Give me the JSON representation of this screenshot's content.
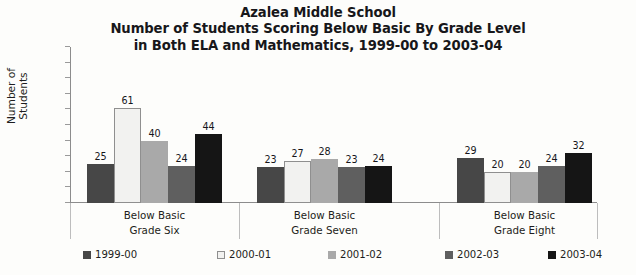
{
  "chart_data": {
    "type": "bar",
    "title": "Azalea Middle School\nNumber of Students Scoring Below Basic By Grade Level\nin Both ELA and Mathematics, 1999-00 to 2003-04",
    "title_lines": [
      "Azalea Middle School",
      "Number of Students Scoring Below Basic By Grade Level",
      "in Both ELA and Mathematics, 1999-00 to 2003-04"
    ],
    "xlabel": "",
    "ylabel": "Number of Students",
    "ylim": [
      0,
      100
    ],
    "yticks": [
      0,
      10,
      20,
      30,
      40,
      50,
      60,
      70,
      80,
      90,
      100
    ],
    "ytick_labels": [
      "0",
      "10",
      "20",
      "30",
      "40",
      "50",
      "60",
      "70",
      "80",
      "90",
      "100"
    ],
    "grid": false,
    "legend_position": "bottom",
    "categories": [
      "Below Basic Grade Six",
      "Below Basic Grade Seven",
      "Below Basic Grade Eight"
    ],
    "category_lines": [
      [
        "Below Basic",
        "Grade Six"
      ],
      [
        "Below Basic",
        "Grade Seven"
      ],
      [
        "Below Basic",
        "Grade Eight"
      ]
    ],
    "series": [
      {
        "name": "1999-00",
        "color": "#474747",
        "values": [
          25,
          23,
          29
        ]
      },
      {
        "name": "2000-01",
        "color": "#f2f2f0",
        "values": [
          61,
          27,
          20
        ]
      },
      {
        "name": "2001-02",
        "color": "#a9a9a9",
        "values": [
          40,
          28,
          20
        ]
      },
      {
        "name": "2002-03",
        "color": "#5f5f5f",
        "values": [
          24,
          23,
          24
        ]
      },
      {
        "name": "2003-04",
        "color": "#151515",
        "values": [
          44,
          24,
          32
        ]
      }
    ],
    "data_labels": [
      [
        "25",
        "61",
        "40",
        "24",
        "44"
      ],
      [
        "23",
        "27",
        "28",
        "23",
        "24"
      ],
      [
        "29",
        "20",
        "20",
        "24",
        "32"
      ]
    ]
  },
  "legend": {
    "items": [
      {
        "label": "1999-00",
        "color": "#474747"
      },
      {
        "label": "2000-01",
        "color": "#f2f2f0"
      },
      {
        "label": "2001-02",
        "color": "#a9a9a9"
      },
      {
        "label": "2002-03",
        "color": "#5f5f5f"
      },
      {
        "label": "2003-04",
        "color": "#151515"
      }
    ]
  }
}
